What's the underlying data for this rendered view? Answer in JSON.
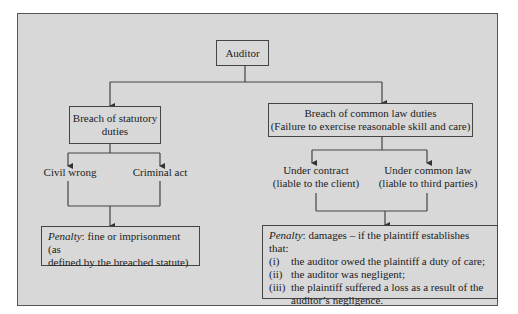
{
  "diagram": {
    "root": "Auditor",
    "left_branch": {
      "title_line1": "Breach of statutory",
      "title_line2": "duties",
      "children": [
        "Civil wrong",
        "Criminal act"
      ],
      "penalty_label": "Penalty",
      "penalty_text_line1": ": fine or imprisonment (as",
      "penalty_text_line2": "defined by the breached statute)"
    },
    "right_branch": {
      "title_line1": "Breach of common law duties",
      "title_line2": "(Failure to exercise reasonable skill and care)",
      "children": [
        {
          "line1": "Under contract",
          "line2": "(liable to the client)"
        },
        {
          "line1": "Under common law",
          "line2": "(liable to third parties)"
        }
      ],
      "penalty_label": "Penalty",
      "penalty_intro": ": damages – if the plaintiff establishes that:",
      "conditions": [
        {
          "num": "(i)",
          "text": "the auditor owed the plaintiff a duty of care;"
        },
        {
          "num": "(ii)",
          "text": "the auditor was negligent;"
        },
        {
          "num": "(iii)",
          "text": "the plaintiff suffered a loss as a result of the"
        },
        {
          "num": "",
          "text": "auditor’s negligence."
        }
      ]
    }
  }
}
